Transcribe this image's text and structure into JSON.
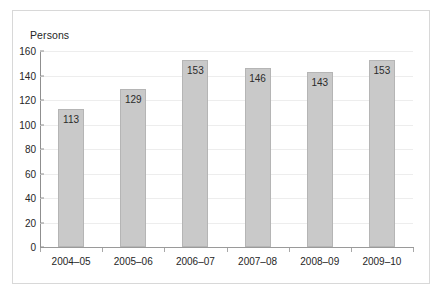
{
  "chart_data": {
    "type": "bar",
    "title": "",
    "subtitle": "",
    "xlabel": "",
    "ylabel": "Persons",
    "categories": [
      "2004–05",
      "2005–06",
      "2006–07",
      "2007–08",
      "2008–09",
      "2009–10"
    ],
    "values": [
      113,
      129,
      153,
      146,
      143,
      153
    ],
    "data_labels": [
      "113",
      "129",
      "153",
      "146",
      "143",
      "153"
    ],
    "ylim": [
      0,
      160
    ],
    "ytick_step": 20,
    "yticks": [
      0,
      20,
      40,
      60,
      80,
      100,
      120,
      140,
      160
    ],
    "ytick_labels": [
      "0",
      "20",
      "40",
      "60",
      "80",
      "100",
      "120",
      "140",
      "160"
    ],
    "grid": "horizontal",
    "legend": "none",
    "legend_position": "none",
    "colors": {
      "bar_fill": "#c9c9c9",
      "bar_border": "#b5b5b5",
      "gridline": "#ededed",
      "axis_line": "#8f8f8f",
      "text": "#262626",
      "frame_border": "#d8d8d8",
      "background": "#ffffff"
    }
  }
}
